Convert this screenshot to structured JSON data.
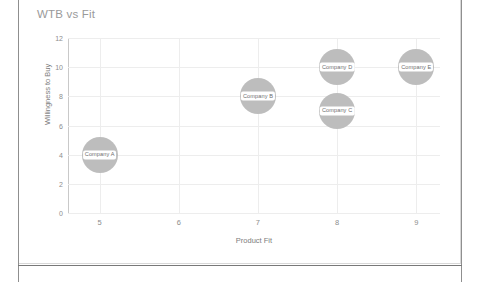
{
  "chart": {
    "title": "WTB vs Fit"
  },
  "chart_data": {
    "type": "scatter",
    "title": "WTB vs Fit",
    "xlabel": "Product Fit",
    "ylabel": "Willingness to Buy",
    "xlim": [
      4.6,
      9.3
    ],
    "ylim": [
      0,
      12
    ],
    "xticks": [
      "5",
      "6",
      "7",
      "8",
      "9"
    ],
    "yticks": [
      "0",
      "2",
      "4",
      "6",
      "8",
      "10",
      "12"
    ],
    "grid": true,
    "legend": "none",
    "points": [
      {
        "label": "Company A",
        "x": 5,
        "y": 4,
        "size": 36,
        "color": "#bdbdbd"
      },
      {
        "label": "Company B",
        "x": 7,
        "y": 8,
        "size": 36,
        "color": "#bdbdbd"
      },
      {
        "label": "Company C",
        "x": 8,
        "y": 7,
        "size": 36,
        "color": "#bdbdbd"
      },
      {
        "label": "Company D",
        "x": 8,
        "y": 10,
        "size": 36,
        "color": "#bdbdbd"
      },
      {
        "label": "Company E",
        "x": 9,
        "y": 10,
        "size": 36,
        "color": "#bdbdbd"
      }
    ]
  },
  "colors": {
    "bubble": "#bdbdbd",
    "gridline": "#ededed",
    "axis": "#c9c9c9",
    "title_text": "#9a9a9a",
    "tick_text": "#8d8d8d",
    "frame": "#8f8f8f"
  }
}
